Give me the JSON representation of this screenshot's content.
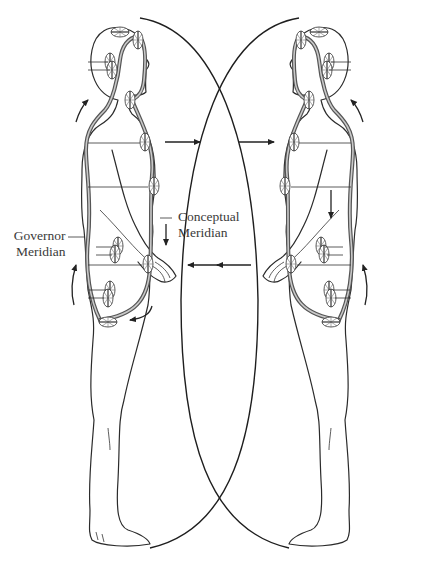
{
  "figure": {
    "type": "illustration",
    "labels": {
      "governor_meridian": [
        "Governor",
        "Meridian"
      ],
      "conceptual_meridian": [
        "Conceptual",
        "Meridian"
      ]
    },
    "caption": "",
    "colors": {
      "line": "#2b2b2b",
      "meridian": "#555555",
      "background": "#ffffff"
    },
    "figures": [
      {
        "name": "left-figure",
        "facing": "right",
        "flow_arrows": [
          "up-back",
          "down-front",
          "right-out-chest",
          "left-in-abdomen",
          "curved-pelvis"
        ]
      },
      {
        "name": "right-figure",
        "facing": "left",
        "flow_arrows": [
          "up-back",
          "down-front",
          "right-in-chest",
          "left-out-abdomen"
        ]
      }
    ]
  }
}
